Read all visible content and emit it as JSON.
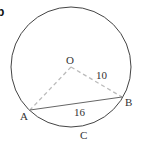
{
  "figure": {
    "corner_label": "b",
    "circle": {
      "center_label": "O",
      "cx": 71,
      "cy": 67,
      "r": 60
    },
    "points": {
      "O": {
        "label": "O",
        "x": 71,
        "y": 67
      },
      "A": {
        "label": "A",
        "x": 30,
        "y": 110
      },
      "B": {
        "label": "B",
        "x": 122,
        "y": 97
      },
      "C": {
        "label": "C"
      }
    },
    "segments": {
      "OB_label": "10",
      "AB_label": "16"
    },
    "colors": {
      "circle": "#444444",
      "dashed": "#bbbbbb",
      "chord": "#666666",
      "text": "#333333"
    }
  }
}
